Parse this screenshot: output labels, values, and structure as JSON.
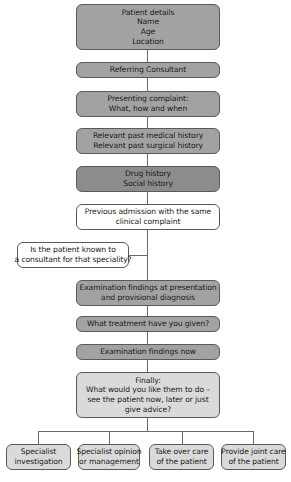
{
  "colors": {
    "dark": "#8c8c8c",
    "mid": "#a2a2a2",
    "light": "#dadada",
    "white": "#ffffff",
    "border": "#5a5a5a",
    "line": "#6a6a6a"
  },
  "flowchart": {
    "main_steps": [
      {
        "lines": [
          "Patient details",
          "Name",
          "Age",
          "Location"
        ],
        "fill": "mid"
      },
      {
        "lines": [
          "Referring Consultant"
        ],
        "fill": "mid"
      },
      {
        "lines": [
          "Presenting complaint:",
          "What, how and when"
        ],
        "fill": "mid"
      },
      {
        "lines": [
          "Relevant past medical history",
          "Relevant past surgical history"
        ],
        "fill": "mid"
      },
      {
        "lines": [
          "Drug history",
          "Social history"
        ],
        "fill": "dark"
      },
      {
        "lines": [
          "Previous admission with the same",
          "clinical complaint"
        ],
        "fill": "white"
      },
      {
        "lines": [
          "Examination findings at presentation",
          "and provisional diagnosis"
        ],
        "fill": "mid"
      },
      {
        "lines": [
          "What treatment have you given?"
        ],
        "fill": "mid"
      },
      {
        "lines": [
          "Examination findings now"
        ],
        "fill": "mid"
      },
      {
        "lines": [
          "Finally:",
          "What would you like them to do –",
          "see the patient now, later or just",
          "give advice?"
        ],
        "fill": "light"
      }
    ],
    "side_question": {
      "lines": [
        "Is the patient known to",
        "a consultant for that speciality?"
      ],
      "fill": "white"
    },
    "outcomes": [
      {
        "lines": [
          "Specialist",
          "investigation"
        ],
        "fill": "light"
      },
      {
        "lines": [
          "Specialist opinion",
          "or management"
        ],
        "fill": "light"
      },
      {
        "lines": [
          "Take over care",
          "of the patient"
        ],
        "fill": "light"
      },
      {
        "lines": [
          "Provide joint care",
          "of the patient"
        ],
        "fill": "light"
      }
    ]
  }
}
